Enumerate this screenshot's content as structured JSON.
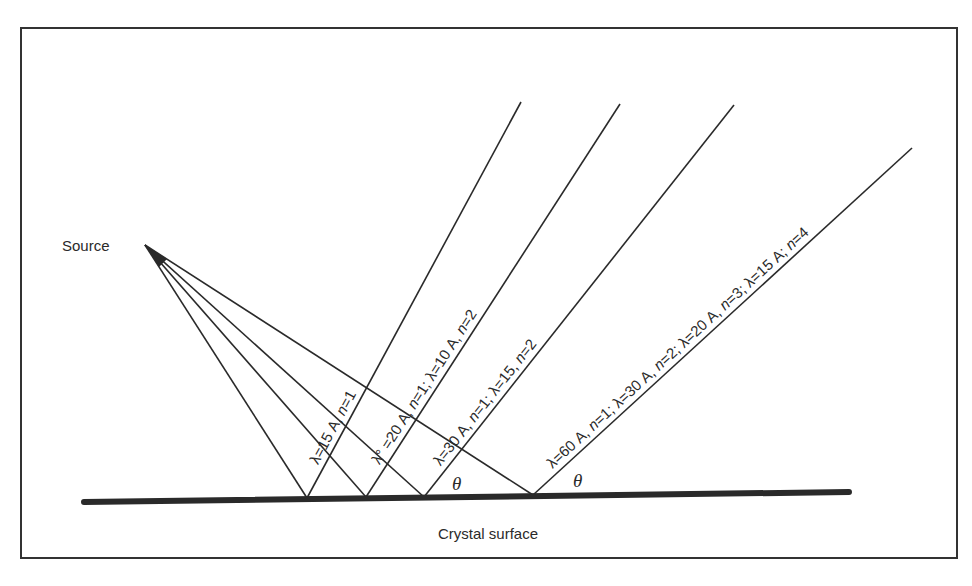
{
  "diagram": {
    "type": "bragg-reflection",
    "source_label": "Source",
    "surface_label": "Crystal surface",
    "angle_symbol": "θ",
    "colors": {
      "ink": "#2a2a2a",
      "background": "#ffffff",
      "frame": "#333333"
    },
    "frame": {
      "x1": 21,
      "y1": 28,
      "x2": 957,
      "y2": 558
    },
    "source": {
      "x": 145,
      "y": 245
    },
    "surface": {
      "x1": 84,
      "y1": 502,
      "x2": 849,
      "y2": 492,
      "thickness": 6
    },
    "rays": [
      {
        "reflect_point": {
          "x": 307,
          "y": 498
        },
        "end_point": {
          "x": 521,
          "y": 102
        },
        "label_parts": [
          "λ=15 A, ",
          "n",
          "=1"
        ],
        "label_text": "λ=15 A, n=1"
      },
      {
        "reflect_point": {
          "x": 366,
          "y": 497
        },
        "end_point": {
          "x": 620,
          "y": 104
        },
        "label_parts": [
          "λ° =20 A, ",
          "n",
          "=1; λ=10 A, ",
          "n",
          "=2"
        ],
        "label_text": "λ° =20 A, n=1; λ=10 A, n=2"
      },
      {
        "reflect_point": {
          "x": 424,
          "y": 497
        },
        "end_point": {
          "x": 734,
          "y": 105
        },
        "label_parts": [
          "λ=30 A, ",
          "n",
          "=1; λ=15,  ",
          "n",
          "=2"
        ],
        "label_text": "λ=30 A, n=1; λ=15, n=2"
      },
      {
        "reflect_point": {
          "x": 533,
          "y": 495
        },
        "end_point": {
          "x": 912,
          "y": 148
        },
        "label_parts": [
          "λ=60 A, ",
          "n",
          "=1; λ=30 A, ",
          "n",
          "=2; λ=20 A, ",
          "n",
          "=3; λ=15 A; ",
          "n",
          "=4"
        ],
        "label_text": "λ=60 A, n=1; λ=30 A, n=2; λ=20 A, n=3; λ=15 A; n=4"
      }
    ],
    "theta_labels": [
      {
        "x": 452,
        "y": 490
      },
      {
        "x": 573,
        "y": 487
      }
    ]
  }
}
